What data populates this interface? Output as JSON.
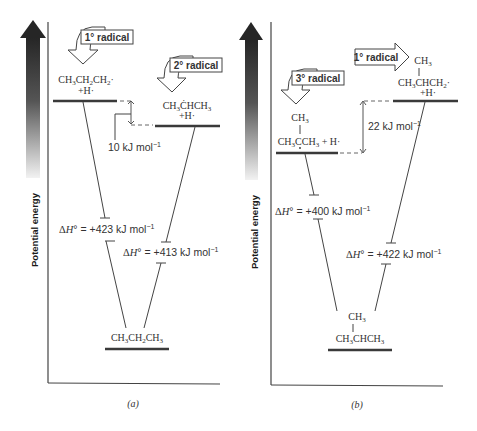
{
  "axis": {
    "ylabel": "Potential energy"
  },
  "panels": [
    {
      "caption": "(a)",
      "upper_left": {
        "badge": "1° radical",
        "formula": "CH3CH2CH2·",
        "plus": "+H·"
      },
      "upper_right": {
        "badge": "2° radical",
        "formula": "CH3ĊHCH3",
        "plus": "+H·"
      },
      "gap_label": "10 kJ mol",
      "gap_sup": "−1",
      "dh_left": {
        "prefix": "ΔH° = ",
        "value": "+423 kJ mol",
        "sup": "−1"
      },
      "dh_right": {
        "prefix": "ΔH° = ",
        "value": "+413 kJ mol",
        "sup": "−1"
      },
      "ground": {
        "formula": "CH3CH2CH3"
      }
    },
    {
      "caption": "(b)",
      "upper_left": {
        "badge": "3° radical",
        "branch": "CH3",
        "formula": "CH3ĊCH3 + H·"
      },
      "upper_right": {
        "badge": "1° radical",
        "branch": "CH3",
        "formula": "CH3CHCH2·",
        "plus": "+H·"
      },
      "gap_label": "22 kJ mol",
      "gap_sup": "−1",
      "dh_left": {
        "prefix": "ΔH° = ",
        "value": "+400 kJ mol",
        "sup": "−1"
      },
      "dh_right": {
        "prefix": "ΔH° = ",
        "value": "+422 kJ mol",
        "sup": "−1"
      },
      "ground": {
        "branch": "CH3",
        "formula": "CH3CHCH3"
      }
    }
  ],
  "colors": {
    "arrow_dark": "#2a2a2a",
    "line": "#444444",
    "level": "#3a3a3a",
    "text": "#333333"
  }
}
